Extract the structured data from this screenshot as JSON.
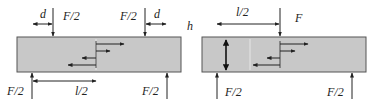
{
  "diagram": {
    "type": "beam-bending-comparison",
    "colors": {
      "beam_fill": "#c8c8c8",
      "beam_stroke": "#555555",
      "line": "#222222",
      "background": "#ffffff"
    },
    "four_point_bending": {
      "labels": {
        "top_left_d": "d",
        "top_left_load": "F/2",
        "top_right_load": "F/2",
        "top_right_d": "d",
        "bottom_left_reaction": "F/2",
        "bottom_span": "l/2",
        "bottom_right_reaction": "F/2"
      }
    },
    "three_point_bending": {
      "labels": {
        "height": "h",
        "top_span": "l/2",
        "top_load": "F",
        "bottom_left_reaction": "F/2",
        "bottom_right_reaction": "F/2"
      }
    }
  }
}
